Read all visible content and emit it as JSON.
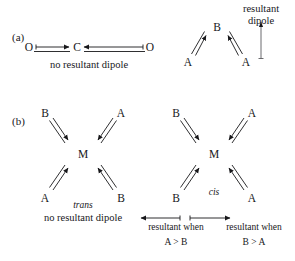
{
  "figure": {
    "background_color": "#ffffff",
    "ink_color": "#17171a",
    "parts": [
      {
        "key": "a",
        "label": "(a)",
        "molecules": [
          {
            "name": "linear-co2",
            "geometry": "linear",
            "atoms": [
              {
                "label": "O",
                "position": "left"
              },
              {
                "label": "C",
                "position": "center"
              },
              {
                "label": "O",
                "position": "right"
              }
            ],
            "bond_dipoles": [
              {
                "from": "O-left",
                "to": "C",
                "direction": "right"
              },
              {
                "from": "O-right",
                "to": "C",
                "direction": "left"
              }
            ],
            "caption": "no resultant dipole",
            "has_resultant": false
          },
          {
            "name": "bent-aba",
            "geometry": "bent",
            "atoms": [
              {
                "label": "B",
                "position": "apex"
              },
              {
                "label": "A",
                "position": "bottom-left"
              },
              {
                "label": "A",
                "position": "bottom-right"
              }
            ],
            "bond_dipoles": [
              {
                "from": "A-left",
                "to": "B",
                "direction": "up-right"
              },
              {
                "from": "A-right",
                "to": "B",
                "direction": "up-left"
              }
            ],
            "resultant_label_line1": "resultant",
            "resultant_label_line2": "dipole",
            "resultant_direction": "up",
            "has_resultant": true
          }
        ]
      },
      {
        "key": "b",
        "label": "(b)",
        "molecules": [
          {
            "name": "trans-isomer",
            "geometry": "square-planar-x",
            "center_atom": "M",
            "atoms": [
              {
                "label": "B",
                "position": "top-left"
              },
              {
                "label": "A",
                "position": "top-right"
              },
              {
                "label": "A",
                "position": "bottom-left"
              },
              {
                "label": "B",
                "position": "bottom-right"
              }
            ],
            "isomer_label": "trans",
            "caption": "no resultant dipole",
            "has_resultant": false
          },
          {
            "name": "cis-isomer",
            "geometry": "square-planar-x",
            "center_atom": "M",
            "atoms": [
              {
                "label": "B",
                "position": "top-left"
              },
              {
                "label": "A",
                "position": "top-right"
              },
              {
                "label": "B",
                "position": "bottom-left"
              },
              {
                "label": "A",
                "position": "bottom-right"
              }
            ],
            "isomer_label": "cis",
            "has_resultant": true,
            "resultant_annotations": [
              {
                "name": "resultant-a-greater-b",
                "arrow_direction": "left",
                "line1": "resultant when",
                "line2": "A > B"
              },
              {
                "name": "resultant-b-greater-a",
                "arrow_direction": "right",
                "line1": "resultant when",
                "line2": "B > A"
              }
            ]
          }
        ]
      }
    ]
  }
}
